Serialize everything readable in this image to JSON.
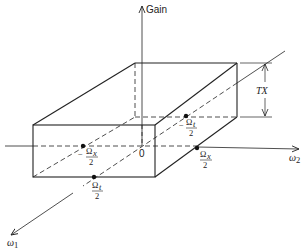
{
  "diagram": {
    "type": "3d-frequency-response-box",
    "axes": {
      "vertical": {
        "label": "Gain"
      },
      "horizontal": {
        "label": "ω",
        "subscript": "2"
      },
      "depth": {
        "label": "ω",
        "subscript": "1"
      }
    },
    "origin_label": "0",
    "height_label": "TX",
    "points": [
      {
        "id": "neg-omega-x-half",
        "sign": "−",
        "numerator": "Ω",
        "sub": "x",
        "denominator": "2"
      },
      {
        "id": "pos-omega-x-half",
        "sign": "",
        "numerator": "Ω",
        "sub": "x",
        "denominator": "2"
      },
      {
        "id": "pos-omega-t-half",
        "sign": "",
        "numerator": "Ω",
        "sub": "t",
        "denominator": "2"
      },
      {
        "id": "neg-omega-t-half",
        "sign": "−",
        "numerator": "Ω",
        "sub": "t",
        "denominator": "2"
      }
    ],
    "colors": {
      "line": "#222222",
      "background": "#ffffff"
    }
  }
}
